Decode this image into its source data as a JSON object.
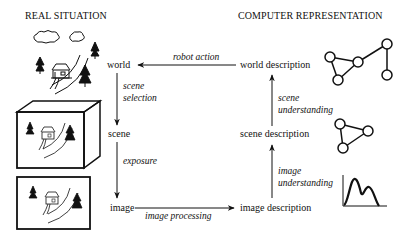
{
  "headers": {
    "left": "REAL SITUATION",
    "right": "COMPUTER REPRESENTATION"
  },
  "nodes": {
    "world": "world",
    "scene": "scene",
    "image": "image",
    "world_description": "world description",
    "scene_description": "scene description",
    "image_description": "image description"
  },
  "edges": {
    "robot_action": "robot action",
    "scene_selection_1": "scene",
    "scene_selection_2": "selection",
    "exposure": "exposure",
    "image_processing": "image processing",
    "image_understanding_1": "image",
    "image_understanding_2": "understanding",
    "scene_understanding_1": "scene",
    "scene_understanding_2": "understanding"
  },
  "icons": {
    "world": "landscape-sketch-icon",
    "scene": "3d-box-scene-icon",
    "image": "framed-image-icon",
    "world_description": "graph-5-nodes-icon",
    "scene_description": "graph-3-nodes-icon",
    "image_description": "histogram-curve-icon"
  },
  "colors": {
    "ink": "#111111",
    "background": "#ffffff"
  }
}
